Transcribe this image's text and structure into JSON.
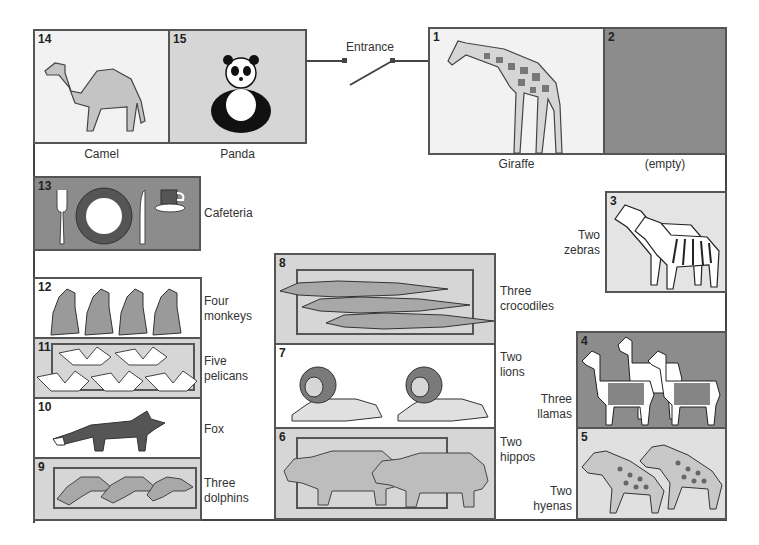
{
  "entrance": {
    "label": "Entrance"
  },
  "colors": {
    "light": "#f2f2f2",
    "mid": "#d6d6d6",
    "dark": "#8c8c8c",
    "border": "#555555"
  },
  "zones": [
    {
      "number": "1",
      "label": "Giraffe",
      "animal": "giraffe",
      "count": 1
    },
    {
      "number": "2",
      "label": "(empty)",
      "animal": null,
      "count": 0
    },
    {
      "number": "3",
      "label_line1": "Two",
      "label_line2": "zebras",
      "animal": "zebra",
      "count": 2
    },
    {
      "number": "4",
      "label_line1": "Three",
      "label_line2": "llamas",
      "animal": "llama",
      "count": 3
    },
    {
      "number": "5",
      "label_line1": "Two",
      "label_line2": "hyenas",
      "animal": "hyena",
      "count": 2
    },
    {
      "number": "6",
      "label_line1": "Two",
      "label_line2": "hippos",
      "animal": "hippo",
      "count": 2
    },
    {
      "number": "7",
      "label_line1": "Two",
      "label_line2": "lions",
      "animal": "lion",
      "count": 2
    },
    {
      "number": "8",
      "label_line1": "Three",
      "label_line2": "crocodiles",
      "animal": "crocodile",
      "count": 3
    },
    {
      "number": "9",
      "label_line1": "Three",
      "label_line2": "dolphins",
      "animal": "dolphin",
      "count": 3
    },
    {
      "number": "10",
      "label": "Fox",
      "animal": "fox",
      "count": 1
    },
    {
      "number": "11",
      "label_line1": "Five",
      "label_line2": "pelicans",
      "animal": "pelican",
      "count": 5
    },
    {
      "number": "12",
      "label_line1": "Four",
      "label_line2": "monkeys",
      "animal": "monkey",
      "count": 4
    },
    {
      "number": "13",
      "label": "Cafeteria",
      "animal": null,
      "count": 0
    },
    {
      "number": "14",
      "label": "Camel",
      "animal": "camel",
      "count": 1
    },
    {
      "number": "15",
      "label": "Panda",
      "animal": "panda",
      "count": 1
    }
  ]
}
